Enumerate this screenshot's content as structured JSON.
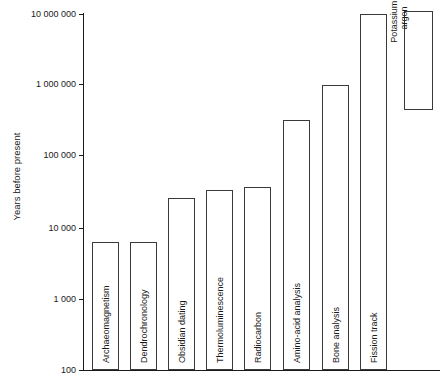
{
  "chart_data": {
    "type": "bar",
    "title": "",
    "subtitle": "",
    "xlabel": "",
    "ylabel": "Years before present",
    "yscale": "log",
    "ylim": [
      100,
      10000000
    ],
    "ytick_labels": [
      "10 000 000",
      "1 000 000",
      "100 000",
      "10 000",
      "1 000",
      "100"
    ],
    "ytick_values": [
      10000000,
      1000000,
      100000,
      10000,
      1000,
      100
    ],
    "grid": false,
    "legend": null,
    "categories": [
      "Archaeomagnetism",
      "Dendrochronology",
      "Obsidian dating",
      "Thermoluminescence",
      "Radiocarbon",
      "Amino-acid analysis",
      "Bone analysis",
      "Fission track",
      "Potassium – argon"
    ],
    "values": [
      6000,
      6000,
      25000,
      32000,
      37000,
      300000,
      1000000,
      10000000,
      7000000
    ],
    "range_start": [
      100,
      100,
      100,
      100,
      100,
      100,
      100,
      100,
      600000
    ]
  },
  "bars": [
    {
      "label": "Archaeomagnetism",
      "x": 92,
      "width": 27,
      "top": 242,
      "bottom": 370,
      "two_line": false
    },
    {
      "label": "Dendrochronology",
      "x": 130,
      "width": 27,
      "top": 242,
      "bottom": 370,
      "two_line": false
    },
    {
      "label": "Obsidian dating",
      "x": 168,
      "width": 27,
      "top": 198,
      "bottom": 370,
      "two_line": false
    },
    {
      "label": "Thermoluminescence",
      "x": 206,
      "width": 27,
      "top": 190,
      "bottom": 370,
      "two_line": false
    },
    {
      "label": "Radiocarbon",
      "x": 244,
      "width": 27,
      "top": 187,
      "bottom": 370,
      "two_line": false
    },
    {
      "label": "Amino-acid analysis",
      "x": 283,
      "width": 27,
      "top": 120,
      "bottom": 370,
      "two_line": false
    },
    {
      "label": "Bone analysis",
      "x": 322,
      "width": 27,
      "top": 85,
      "bottom": 370,
      "two_line": false
    },
    {
      "label": "Fission track",
      "x": 360,
      "width": 27,
      "top": 14,
      "bottom": 370,
      "two_line": false
    },
    {
      "label": "Potassium –\nargon",
      "x": 404,
      "width": 29,
      "top": 11,
      "bottom": 110,
      "two_line": true
    }
  ],
  "yticks": [
    {
      "label": "10 000 000",
      "y": 14
    },
    {
      "label": "1 000 000",
      "y": 84
    },
    {
      "label": "100 000",
      "y": 155
    },
    {
      "label": "10 000",
      "y": 228
    },
    {
      "label": "1 000",
      "y": 299
    },
    {
      "label": "100",
      "y": 370
    }
  ]
}
